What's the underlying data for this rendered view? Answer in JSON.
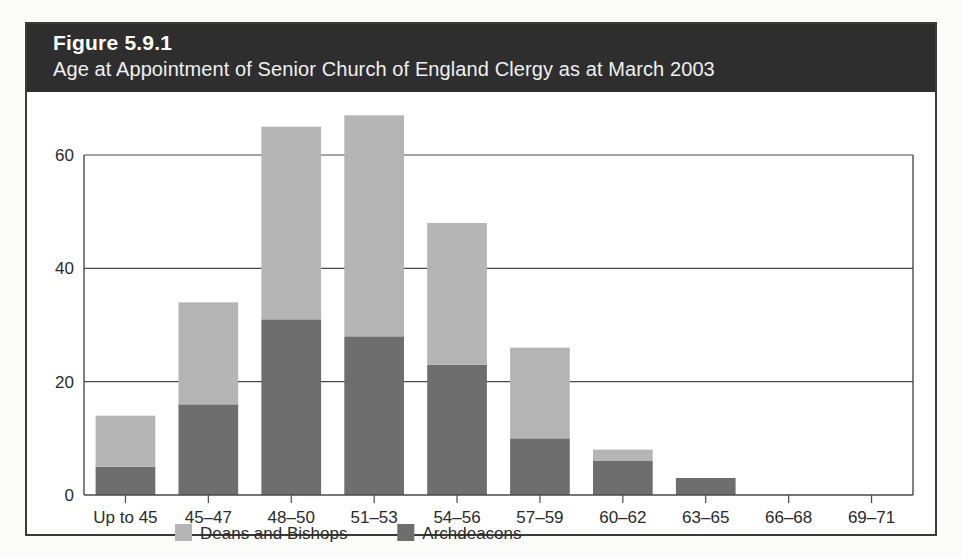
{
  "figure": {
    "number": "Figure 5.9.1",
    "title": "Age at Appointment of Senior Church of England Clergy as at March 2003"
  },
  "colors": {
    "band_background": "#2e2e2e",
    "deans_and_bishops": "#b5b5b5",
    "archdeacons": "#6e6e6e",
    "axis": "#4a4a4a",
    "card_border": "#3a3a3a"
  },
  "axis": {
    "y_ticks": [
      "0",
      "20",
      "40",
      "60"
    ],
    "x_labels": [
      "Up to 45",
      "45–47",
      "48–50",
      "51–53",
      "54–56",
      "57–59",
      "60–62",
      "63–65",
      "66–68",
      "69–71"
    ]
  },
  "legend": {
    "items": [
      {
        "label": "Deans and Bishops",
        "color": "#b5b5b5"
      },
      {
        "label": "Archdeacons",
        "color": "#6e6e6e"
      }
    ]
  },
  "chart_data": {
    "type": "bar",
    "stacked": true,
    "title": "Age at Appointment of Senior Church of England Clergy as at March 2003",
    "xlabel": "",
    "ylabel": "",
    "ylim": [
      0,
      70
    ],
    "yticks": [
      0,
      20,
      40,
      60
    ],
    "grid": true,
    "legend_position": "bottom",
    "categories": [
      "Up to 45",
      "45–47",
      "48–50",
      "51–53",
      "54–56",
      "57–59",
      "60–62",
      "63–65",
      "66–68",
      "69–71"
    ],
    "series": [
      {
        "name": "Archdeacons",
        "color": "#6e6e6e",
        "values": [
          5,
          16,
          31,
          28,
          23,
          10,
          6,
          3,
          0,
          0
        ]
      },
      {
        "name": "Deans and Bishops",
        "color": "#b5b5b5",
        "values": [
          9,
          18,
          34,
          39,
          25,
          16,
          2,
          0,
          0,
          0
        ]
      }
    ],
    "totals": [
      14,
      34,
      65,
      67,
      48,
      26,
      8,
      3,
      0,
      0
    ]
  }
}
